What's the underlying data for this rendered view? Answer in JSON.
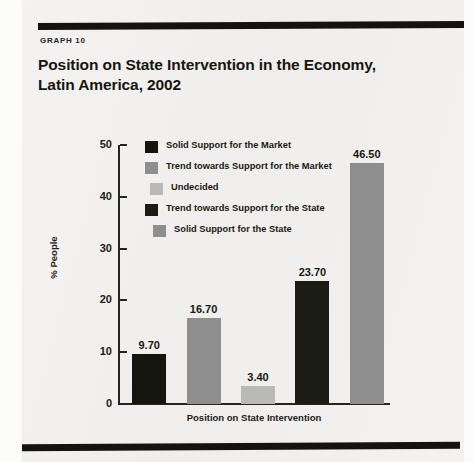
{
  "figure": {
    "kicker": "GRAPH  10"
  },
  "colors": {
    "page_background": "#f2f1ef",
    "rule": "#14130f",
    "axis": "#26251e",
    "text": "#17160f",
    "solid_market": "#151510",
    "trend_market": "#8e8e8e",
    "undecided": "#b9b9b7",
    "trend_state": "#1c1c16",
    "solid_state": "#8e8e8e"
  },
  "chart_data": {
    "type": "bar",
    "xlabel": "Position on State Intervention",
    "ylabel": "% People",
    "ylim": [
      0,
      50
    ],
    "yticks": [
      0,
      10,
      20,
      30,
      40,
      50
    ],
    "ytick_labels": [
      "0",
      "10",
      "20",
      "30",
      "40",
      "50"
    ],
    "grid": false,
    "legend_position": "upper-center-inside",
    "categories": [
      "Solid Support for the Market",
      "Trend towards Support for the Market",
      "Undecided",
      "Trend towards Support for the State",
      "Solid Support for the State"
    ],
    "values": [
      9.7,
      16.7,
      3.4,
      23.7,
      46.5
    ],
    "value_labels": [
      "9.70",
      "16.70",
      "3.40",
      "23.70",
      "46.50"
    ],
    "bar_colors": [
      "#151510",
      "#8e8e8e",
      "#b9b9b7",
      "#1c1c16",
      "#8e8e8e"
    ]
  },
  "legend": {
    "items": [
      {
        "label": "Solid Support for the Market",
        "color": "#151510"
      },
      {
        "label": "Trend towards Support for the Market",
        "color": "#8e8e8e"
      },
      {
        "label": "Undecided",
        "color": "#b9b9b7"
      },
      {
        "label": "Trend towards Support for the State",
        "color": "#1c1c16"
      },
      {
        "label": "Solid Support for the State",
        "color": "#8e8e8e"
      }
    ]
  }
}
